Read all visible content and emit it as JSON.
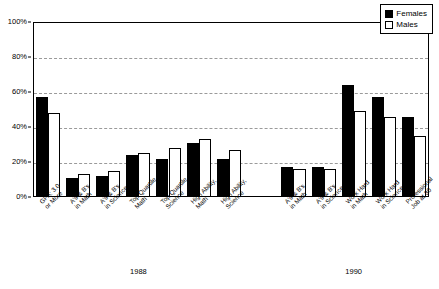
{
  "chart_data": {
    "type": "bar",
    "title": "",
    "subtitle": "",
    "xlabel": "",
    "ylabel": "",
    "ylim": [
      0,
      100
    ],
    "y_unit": "%",
    "grid": true,
    "grid_axis": "y",
    "legend_position": "top-right",
    "y_ticks": [
      "0%",
      "20%",
      "40%",
      "60%",
      "80%",
      "100%"
    ],
    "y_tick_values": [
      0,
      20,
      40,
      60,
      80,
      100
    ],
    "legend": [
      {
        "name": "Females",
        "fill": "#000000",
        "edge": "#000000"
      },
      {
        "name": "Males",
        "fill": "#ffffff",
        "edge": "#000000"
      }
    ],
    "series": [
      {
        "name": "Females",
        "values": [
          57,
          11,
          12,
          24,
          22,
          31,
          22,
          17,
          17,
          64,
          57,
          46
        ]
      },
      {
        "name": "Males",
        "values": [
          48,
          13,
          15,
          25,
          28,
          33,
          27,
          16,
          16,
          49,
          46,
          35
        ]
      }
    ],
    "categories": [
      "GPA: 3.0 or More",
      "A's & B's in Math",
      "A's & B's in Science",
      "Top Quartile, Math",
      "Top Quartile, Science",
      "High Ability, Math",
      "High Ability, Science",
      "A's & B's in Math",
      "A's & B's in Science",
      "Work Hard in Math",
      "Work Hard in Science",
      "Professional Job at 30"
    ],
    "category_lines": [
      [
        "GPA: 3.0",
        "or More"
      ],
      [
        "A's & B's",
        "in Math"
      ],
      [
        "A's & B's",
        "in Science"
      ],
      [
        "Top Quartile,",
        "Math"
      ],
      [
        "Top Quartile,",
        "Science"
      ],
      [
        "High Ability,",
        "Math"
      ],
      [
        "High Ability,",
        "Science"
      ],
      [
        "A's & B's",
        "in Math"
      ],
      [
        "A's & B's",
        "in Science"
      ],
      [
        "Work Hard",
        "in Math"
      ],
      [
        "Work Hard",
        "in Science"
      ],
      [
        "Professional",
        "Job at 30"
      ]
    ],
    "groups": [
      {
        "label": "1988",
        "start_index": 0,
        "end_index": 6
      },
      {
        "label": "1990",
        "start_index": 7,
        "end_index": 11
      }
    ]
  }
}
